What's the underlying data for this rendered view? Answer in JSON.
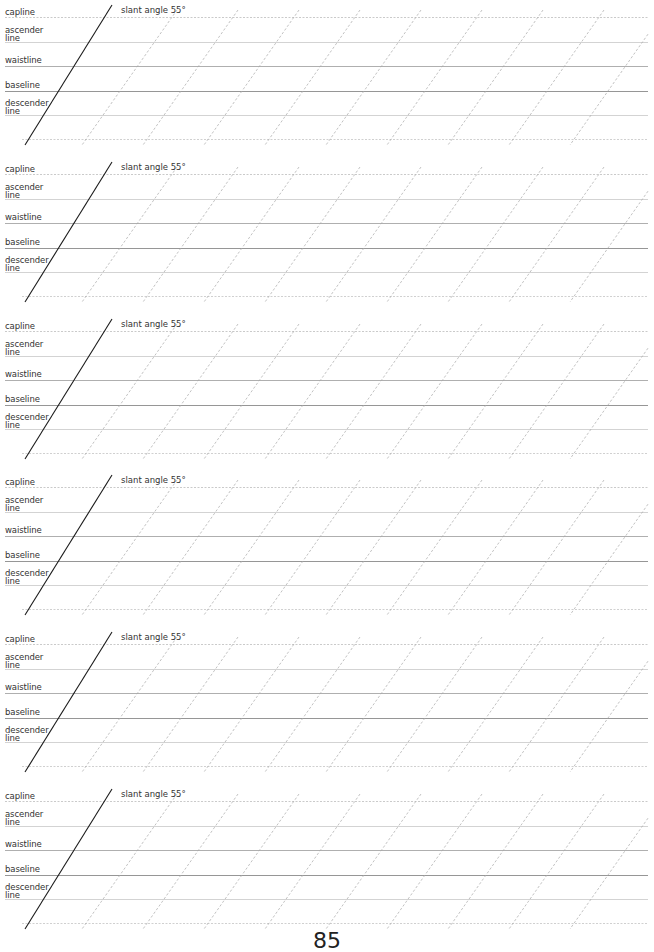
{
  "sheet": {
    "title": "Calligraphy slant practice sheet",
    "block_count": 6,
    "block_top_first": 17,
    "block_pitch": 156.8,
    "line_right_edge": 648,
    "line_left_edge": 5,
    "line_offsets": {
      "capline": 0,
      "ascender": 25,
      "waistline": 49,
      "baseline": 74,
      "descender": 98,
      "bottom": 122
    },
    "labels": {
      "capline": "capline",
      "ascender": "ascender\nline",
      "waistline": "waistline",
      "baseline": "baseline",
      "descender": "descender\nline",
      "slant": "slant angle 55°"
    },
    "slant_angle_deg": 55,
    "guide": {
      "main_top_x": 112,
      "main_bottom_x": 25,
      "dashed_first_top_x": 177,
      "dashed_spacing": 61,
      "dashed_count": 9,
      "dashed_dx": 95
    },
    "colors": {
      "capline": "#bdbdbd",
      "ascender": "#c8c8c8",
      "waistline": "#9a9a9a",
      "baseline": "#8a8a8a",
      "descender": "#c8c8c8",
      "bottom": "#c4c4c4",
      "slant_main": "#1a1a1a",
      "slant_dashed": "#a8a8a8",
      "text": "#333333"
    }
  },
  "blocks": [
    {
      "index": 1,
      "capline": "capline",
      "ascender": "ascender\nline",
      "waistline": "waistline",
      "baseline": "baseline",
      "descender": "descender\nline",
      "slant": "slant angle 55°"
    },
    {
      "index": 2,
      "capline": "capline",
      "ascender": "ascender\nline",
      "waistline": "waistline",
      "baseline": "baseline",
      "descender": "descender\nline",
      "slant": "slant angle 55°"
    },
    {
      "index": 3,
      "capline": "capline",
      "ascender": "ascender\nline",
      "waistline": "waistline",
      "baseline": "baseline",
      "descender": "descender\nline",
      "slant": "slant angle 55°"
    },
    {
      "index": 4,
      "capline": "capline",
      "ascender": "ascender\nline",
      "waistline": "waistline",
      "baseline": "baseline",
      "descender": "descender\nline",
      "slant": "slant angle 55°"
    },
    {
      "index": 5,
      "capline": "capline",
      "ascender": "ascender\nline",
      "waistline": "waistline",
      "baseline": "baseline",
      "descender": "descender\nline",
      "slant": "slant angle 55°"
    },
    {
      "index": 6,
      "capline": "capline",
      "ascender": "ascender\nline",
      "waistline": "waistline",
      "baseline": "baseline",
      "descender": "descender\nline",
      "slant": "slant angle 55°"
    }
  ],
  "footer": {
    "page_number": "85"
  }
}
